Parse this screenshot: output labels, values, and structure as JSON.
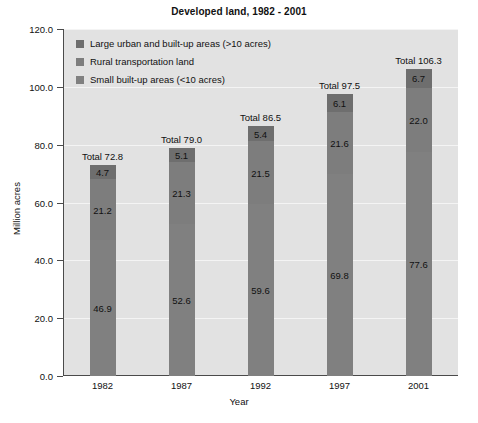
{
  "chart_data": {
    "type": "bar",
    "title": "Developed land, 1982 - 2001",
    "xlabel": "Year",
    "ylabel": "Million acres",
    "ylim": [
      0,
      120
    ],
    "ytick_labels": [
      "0.0",
      "20.0",
      "40.0",
      "60.0",
      "80.0",
      "100.0",
      "120.0"
    ],
    "ytick_values": [
      0,
      20,
      40,
      60,
      80,
      100,
      120
    ],
    "grid": true,
    "stacked": true,
    "legend_position": "upper-left-inside",
    "categories": [
      "1982",
      "1987",
      "1992",
      "1997",
      "2001"
    ],
    "series": [
      {
        "name": "Small built-up areas (<10 acres)",
        "color": "#808080",
        "values": [
          46.9,
          52.6,
          59.6,
          69.8,
          77.6
        ]
      },
      {
        "name": "Rural transportation land",
        "color": "#7d7d7d",
        "values": [
          21.2,
          21.3,
          21.5,
          21.6,
          22.0
        ]
      },
      {
        "name": "Large urban and built-up areas (>10 acres)",
        "color": "#6e6e6e",
        "values": [
          4.7,
          5.1,
          5.4,
          6.1,
          6.7
        ]
      }
    ],
    "totals": [
      72.8,
      79.0,
      86.5,
      97.5,
      106.3
    ],
    "total_labels": [
      "Total 72.8",
      "Total 79.0",
      "Total 86.5",
      "Total 97.5",
      "Total 106.3"
    ],
    "annotations": {
      "1982": [
        "4.7",
        "21.2",
        "46.9"
      ],
      "1987": [
        "5.1",
        "21.3",
        "52.6"
      ],
      "1992": [
        "5.4",
        "21.5",
        "59.6"
      ],
      "1997": [
        "6.1",
        "21.6",
        "69.8"
      ],
      "2001": [
        "6.7",
        "22.0",
        "77.6"
      ]
    }
  },
  "legend": {
    "items": [
      {
        "label": "Large urban and built-up areas (>10 acres)",
        "color": "#6e6e6e"
      },
      {
        "label": "Rural transportation land",
        "color": "#7d7d7d"
      },
      {
        "label": "Small built-up areas (<10 acres)",
        "color": "#808080"
      }
    ]
  },
  "colors": {
    "plot_background": "#e2e2e2",
    "gridline": "#f4f4f4",
    "axis": "#4a4a4a",
    "text": "#111111",
    "bar_top": "#6e6e6e",
    "bar_middle": "#7d7d7d",
    "bar_bottom": "#808080"
  }
}
